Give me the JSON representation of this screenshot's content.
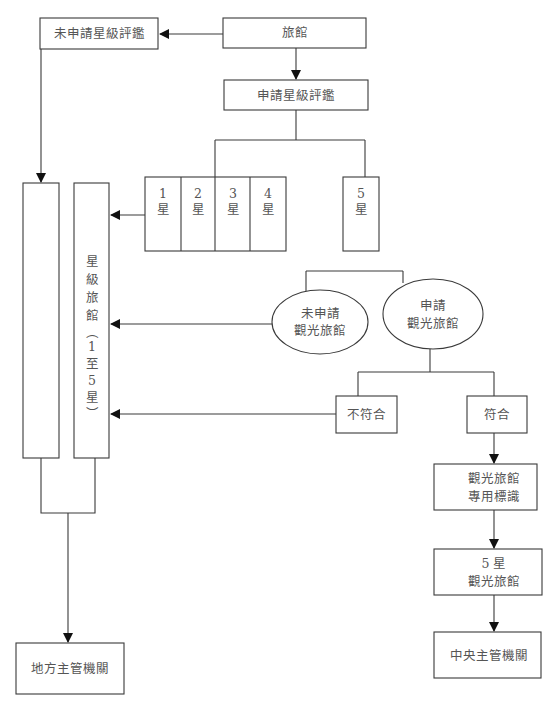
{
  "diagram": {
    "type": "flowchart",
    "nodes": {
      "not_applied_star_rating": "未申請星級評鑑",
      "hotel": "旅館",
      "apply_star_rating": "申請星級評鑑",
      "star1": {
        "num": "1",
        "unit": "星"
      },
      "star2": {
        "num": "2",
        "unit": "星"
      },
      "star3": {
        "num": "3",
        "unit": "星"
      },
      "star4": {
        "num": "4",
        "unit": "星"
      },
      "star5": {
        "num": "5",
        "unit": "星"
      },
      "star_hotel_column": [
        "星",
        "級",
        "旅",
        "館",
        "︵",
        "1",
        "至",
        "5",
        "星",
        "︶"
      ],
      "not_applied_tourist_hotel": {
        "line1": "未申請",
        "line2": "觀光旅館"
      },
      "applied_tourist_hotel": {
        "line1": "申請",
        "line2": "觀光旅館"
      },
      "not_qualified": "不符合",
      "qualified": "符合",
      "tourist_hotel_mark": {
        "line1": "觀光旅館",
        "line2": "專用標識"
      },
      "five_star_tourist_hotel": {
        "line1": "5 星",
        "line2": "觀光旅館"
      },
      "central_authority": "中央主管機關",
      "local_authority": "地方主管機關"
    },
    "edges": [
      {
        "from": "旅館",
        "to": "未申請星級評鑑"
      },
      {
        "from": "旅館",
        "to": "申請星級評鑑"
      },
      {
        "from": "申請星級評鑑",
        "to": "1-4星 / 5星"
      },
      {
        "from": "1-4星",
        "to": "星級旅館(1至5星)"
      },
      {
        "from": "未申請星級評鑑",
        "to": "left column"
      },
      {
        "from": "5星",
        "to": "未申請觀光旅館 / 申請觀光旅館"
      },
      {
        "from": "未申請觀光旅館",
        "to": "星級旅館(1至5星)"
      },
      {
        "from": "申請觀光旅館",
        "to": "不符合 / 符合"
      },
      {
        "from": "不符合",
        "to": "星級旅館(1至5星)"
      },
      {
        "from": "符合",
        "to": "觀光旅館專用標識"
      },
      {
        "from": "觀光旅館專用標識",
        "to": "5星觀光旅館"
      },
      {
        "from": "5星觀光旅館",
        "to": "中央主管機關"
      },
      {
        "from": "columns",
        "to": "地方主管機關"
      }
    ]
  }
}
